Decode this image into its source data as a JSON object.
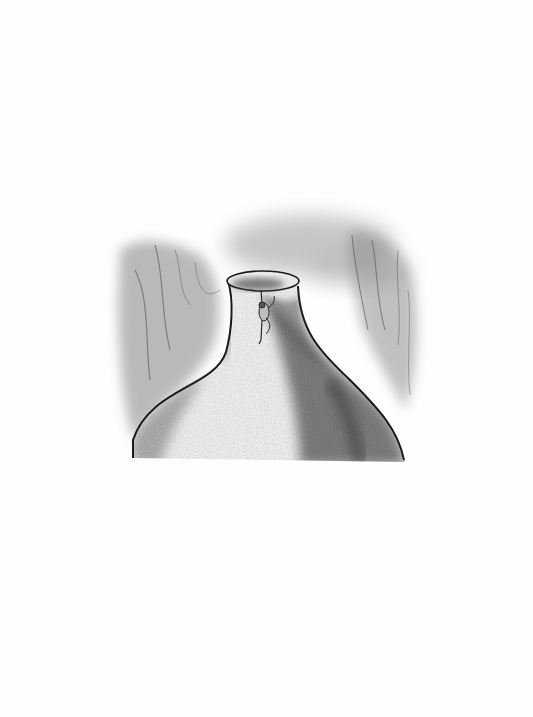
{
  "illustration": {
    "subject": "pencil drawing of a small figure climbing the neck of a giant bottle-shaped form in a forest",
    "medium": "graphite on white paper",
    "colors": {
      "paper": "#fefefe",
      "outline": "#1a1a1a",
      "shade_dark": "#3a3a3a",
      "shade_mid": "#7a7a7a",
      "shade_light": "#bdbdbd"
    },
    "elements": [
      "background-trees-left",
      "background-trees-right",
      "background-foliage-top",
      "bottle-form",
      "bottle-opening",
      "climbing-figure"
    ]
  }
}
